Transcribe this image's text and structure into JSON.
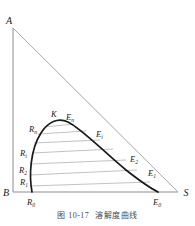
{
  "figure": {
    "caption_number": "图 10-17",
    "caption_text": "溶解度曲线",
    "type": "right-triangular ternary phase diagram"
  },
  "vertices": [
    {
      "id": "A",
      "label": "A",
      "x": 13,
      "y": 28,
      "anchor": "top-left"
    },
    {
      "id": "B",
      "label": "B",
      "x": 13,
      "y": 192,
      "anchor": "bottom-left"
    },
    {
      "id": "S",
      "label": "S",
      "x": 178,
      "y": 192,
      "anchor": "bottom-right"
    }
  ],
  "plait_point": {
    "id": "K",
    "label": "K",
    "x": 55,
    "y": 120
  },
  "raffinate_points": [
    {
      "label": "R",
      "sub": "0",
      "x": 32,
      "y": 192
    },
    {
      "label": "R",
      "sub": "1",
      "x": 28,
      "y": 180
    },
    {
      "label": "R",
      "sub": "2",
      "x": 27,
      "y": 169
    },
    {
      "label": "R",
      "sub": "i",
      "x": 28,
      "y": 152
    },
    {
      "label": "R",
      "sub": "n",
      "x": 37,
      "y": 129
    }
  ],
  "extract_points": [
    {
      "label": "E",
      "sub": "0",
      "x": 160,
      "y": 192
    },
    {
      "label": "E",
      "sub": "1",
      "x": 145,
      "y": 173
    },
    {
      "label": "E",
      "sub": "2",
      "x": 128,
      "y": 159
    },
    {
      "label": "E",
      "sub": "i",
      "x": 98,
      "y": 135
    },
    {
      "label": "E",
      "sub": "n",
      "x": 70,
      "y": 119
    }
  ],
  "curves": {
    "binodal_label": "solubility-curve",
    "binodal_path": "M 32,192 C 29,176 30,150 41,133 C 48,122 58,117 68,122 C 82,129 104,152 126,170 C 140,181 152,189 158,192",
    "hypotenuse": {
      "x1": 13,
      "y1": 28,
      "x2": 178,
      "y2": 192
    },
    "left_leg": {
      "x1": 13,
      "y1": 28,
      "x2": 13,
      "y2": 192
    },
    "bottom_leg": {
      "x1": 13,
      "y1": 192,
      "x2": 178,
      "y2": 192
    }
  },
  "tie_lines": [
    {
      "index": 0,
      "x1": 30,
      "y1": 186,
      "x2": 150,
      "y2": 182
    },
    {
      "index": 1,
      "x1": 30,
      "y1": 175,
      "x2": 137,
      "y2": 170
    },
    {
      "index": 2,
      "x1": 30,
      "y1": 164,
      "x2": 126,
      "y2": 160
    },
    {
      "index": 3,
      "x1": 32,
      "y1": 153,
      "x2": 113,
      "y2": 149
    },
    {
      "index": 4,
      "x1": 34,
      "y1": 143,
      "x2": 100,
      "y2": 140
    },
    {
      "index": 5,
      "x1": 38,
      "y1": 134,
      "x2": 86,
      "y2": 131
    },
    {
      "index": 6,
      "x1": 44,
      "y1": 127,
      "x2": 74,
      "y2": 124
    }
  ],
  "colors": {
    "binodal_stroke": "#1a1a1a",
    "triangle_stroke": "#9a9a9a",
    "tie_line_stroke": "#b0b0b0",
    "label_color": "#1a1a1a",
    "caption_color": "#4a4a4a",
    "background": "#ffffff"
  }
}
